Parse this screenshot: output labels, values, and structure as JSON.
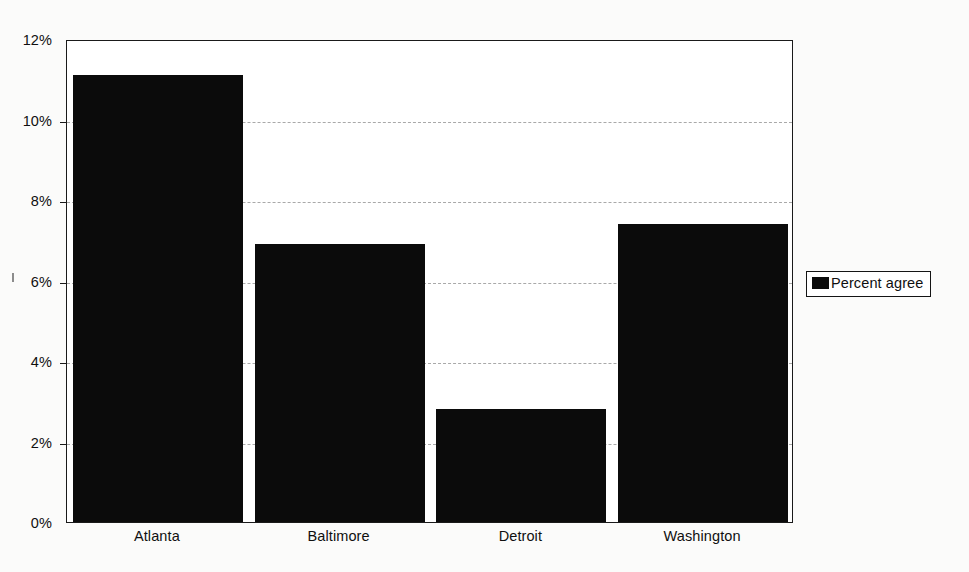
{
  "chart_data": {
    "type": "bar",
    "title": "",
    "subtitle": "",
    "xlabel": "",
    "ylabel": "",
    "categories": [
      "Atlanta",
      "Baltimore",
      "Detroit",
      "Washington"
    ],
    "series": [
      {
        "name": "Percent agree",
        "values": [
          11.1,
          6.9,
          2.8,
          7.4
        ],
        "color": "#0b0b0b"
      }
    ],
    "ylim": [
      0,
      12
    ],
    "ytick_values": [
      0,
      2,
      4,
      6,
      8,
      10,
      12
    ],
    "ytick_labels": [
      "0%",
      "2%",
      "4%",
      "6%",
      "8%",
      "10%",
      "12%"
    ],
    "grid": true,
    "grid_style": "dashed",
    "grid_color": "#a9a9a9",
    "legend": {
      "position": "right",
      "entries": [
        {
          "label": "Percent agree",
          "swatch": "legend-swatch-black",
          "color": "#0b0b0b"
        }
      ]
    },
    "frame_color": "#1a1a1a",
    "background_color": "#ffffff"
  }
}
